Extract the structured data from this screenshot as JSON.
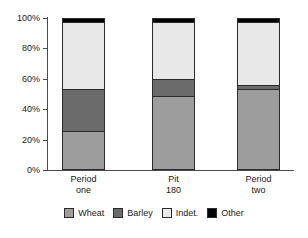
{
  "chart_data": {
    "type": "bar",
    "subtype": "stacked-percentage",
    "title": "",
    "xlabel": "",
    "ylabel": "",
    "ylim": [
      0,
      100
    ],
    "grid": false,
    "legend_position": "bottom",
    "categories": [
      "Period one",
      "Pit 180",
      "Period two"
    ],
    "category_lines": [
      [
        "Period",
        "one"
      ],
      [
        "Pit",
        "180"
      ],
      [
        "Period",
        "two"
      ]
    ],
    "ytick_labels": [
      "0%",
      "20%",
      "40%",
      "60%",
      "80%",
      "100%"
    ],
    "ytick_values": [
      0,
      20,
      40,
      60,
      80,
      100
    ],
    "series": [
      {
        "name": "Wheat",
        "color": "#9d9d9d",
        "values": [
          25,
          49,
          53
        ]
      },
      {
        "name": "Barley",
        "color": "#6b6b6b",
        "values": [
          28,
          11,
          3
        ]
      },
      {
        "name": "Indet.",
        "color": "#e8e8e8",
        "values": [
          45,
          38,
          42
        ]
      },
      {
        "name": "Other",
        "color": "#000000",
        "values": [
          2,
          2,
          2
        ]
      }
    ]
  },
  "legend": {
    "items": [
      {
        "label": "Wheat",
        "color": "#9d9d9d"
      },
      {
        "label": "Barley",
        "color": "#6b6b6b"
      },
      {
        "label": "Indet.",
        "color": "#e8e8e8"
      },
      {
        "label": "Other",
        "color": "#000000"
      }
    ]
  },
  "axis": {
    "y_ticks": [
      {
        "label": "100%",
        "value": 100
      },
      {
        "label": "80%",
        "value": 80
      },
      {
        "label": "60%",
        "value": 60
      },
      {
        "label": "40%",
        "value": 40
      },
      {
        "label": "20%",
        "value": 20
      },
      {
        "label": "0%",
        "value": 0
      }
    ]
  }
}
